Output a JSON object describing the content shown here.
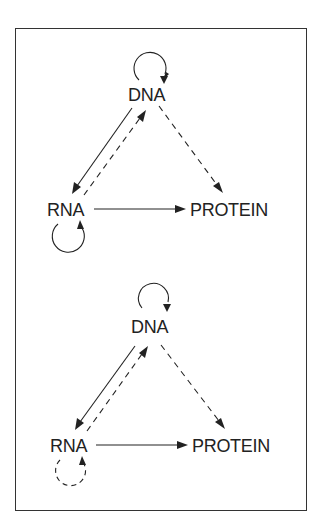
{
  "figure": {
    "type": "central-dogma-diagram",
    "panels": [
      {
        "id": "top",
        "nodes": [
          {
            "id": "dna",
            "label": "DNA"
          },
          {
            "id": "rna",
            "label": "RNA"
          },
          {
            "id": "protein",
            "label": "PROTEIN"
          }
        ],
        "edges": [
          {
            "from": "DNA",
            "to": "DNA",
            "style": "solid"
          },
          {
            "from": "DNA",
            "to": "RNA",
            "style": "solid"
          },
          {
            "from": "RNA",
            "to": "DNA",
            "style": "dashed"
          },
          {
            "from": "DNA",
            "to": "PROTEIN",
            "style": "dashed"
          },
          {
            "from": "RNA",
            "to": "PROTEIN",
            "style": "solid"
          },
          {
            "from": "RNA",
            "to": "RNA",
            "style": "solid"
          }
        ]
      },
      {
        "id": "bottom",
        "nodes": [
          {
            "id": "dna",
            "label": "DNA"
          },
          {
            "id": "rna",
            "label": "RNA"
          },
          {
            "id": "protein",
            "label": "PROTEIN"
          }
        ],
        "edges": [
          {
            "from": "DNA",
            "to": "DNA",
            "style": "solid"
          },
          {
            "from": "DNA",
            "to": "RNA",
            "style": "solid"
          },
          {
            "from": "RNA",
            "to": "DNA",
            "style": "dashed"
          },
          {
            "from": "DNA",
            "to": "PROTEIN",
            "style": "dashed"
          },
          {
            "from": "RNA",
            "to": "PROTEIN",
            "style": "solid"
          },
          {
            "from": "RNA",
            "to": "RNA",
            "style": "dashed"
          }
        ]
      }
    ]
  },
  "colors": {
    "ink": "#222222",
    "border": "#333333",
    "background": "#ffffff"
  }
}
